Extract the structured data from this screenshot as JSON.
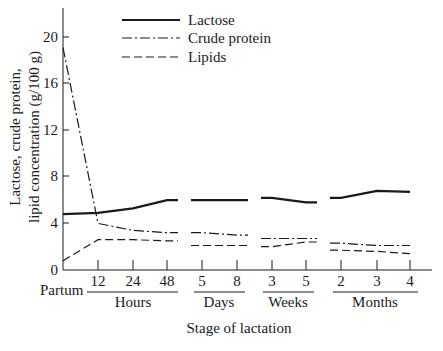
{
  "chart_data": {
    "type": "line",
    "title": "",
    "xlabel": "Stage of lactation",
    "ylabel_lines": [
      "Lactose, crude protein,",
      "lipid concentration (g/100 g)"
    ],
    "ylabel": "Lactose, crude protein, lipid concentration (g/100 g)",
    "ylim": [
      0,
      20
    ],
    "yticks": [
      0,
      4,
      8,
      12,
      16,
      20
    ],
    "grid": false,
    "legend_position": "top",
    "x_origin_label": "Partum",
    "categories": [
      "Partum",
      "12",
      "24",
      "48",
      "5",
      "8",
      "3",
      "5",
      "2",
      "3",
      "4"
    ],
    "x_groups": [
      {
        "label": "Hours",
        "ticks": [
          "12",
          "24",
          "48"
        ]
      },
      {
        "label": "Days",
        "ticks": [
          "5",
          "8"
        ]
      },
      {
        "label": "Weeks",
        "ticks": [
          "3",
          "5"
        ]
      },
      {
        "label": "Months",
        "ticks": [
          "2",
          "3",
          "4"
        ]
      }
    ],
    "series": [
      {
        "name": "Lactose",
        "style": "solid",
        "values": [
          4.8,
          4.9,
          5.3,
          6.0,
          6.0,
          6.0,
          6.2,
          5.8,
          6.2,
          6.8,
          6.7
        ]
      },
      {
        "name": "Crude protein",
        "style": "dash-dot",
        "values": [
          19.1,
          4.0,
          3.4,
          3.2,
          3.2,
          3.0,
          2.7,
          2.7,
          2.3,
          2.1,
          2.1
        ]
      },
      {
        "name": "Lipids",
        "style": "dashed",
        "values": [
          0.8,
          2.6,
          2.6,
          2.5,
          2.1,
          2.1,
          2.0,
          2.4,
          1.7,
          1.6,
          1.4
        ]
      }
    ]
  },
  "legend": {
    "items": [
      {
        "label": "Lactose"
      },
      {
        "label": "Crude protein"
      },
      {
        "label": "Lipids"
      }
    ]
  },
  "axes": {
    "y_tick_labels": [
      "0",
      "4",
      "8",
      "12",
      "16",
      "20"
    ],
    "x_tick_labels": [
      "12",
      "24",
      "48",
      "5",
      "8",
      "3",
      "5",
      "2",
      "3",
      "4"
    ],
    "origin_label": "Partum",
    "group_labels": [
      "Hours",
      "Days",
      "Weeks",
      "Months"
    ],
    "x_title": "Stage of lactation",
    "y_title_line1": "Lactose, crude protein,",
    "y_title_line2": "lipid concentration (g/100 g)"
  }
}
